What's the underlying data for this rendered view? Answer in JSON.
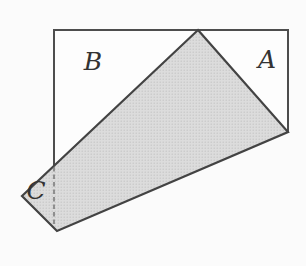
{
  "figure": {
    "labels": {
      "region_a": "A",
      "region_b": "B",
      "region_c": "C"
    },
    "colors": {
      "background": "#fbfbfb",
      "sheet_fill": "#fdfdfd",
      "flap_fill_base": "#dcdcdc",
      "flap_fill_dot": "#c2c2c2",
      "outline_stroke": "#4d4d4d",
      "flap_stroke": "#434343",
      "dashed_stroke": "#6f6f6f",
      "label_color": "#333333"
    }
  }
}
